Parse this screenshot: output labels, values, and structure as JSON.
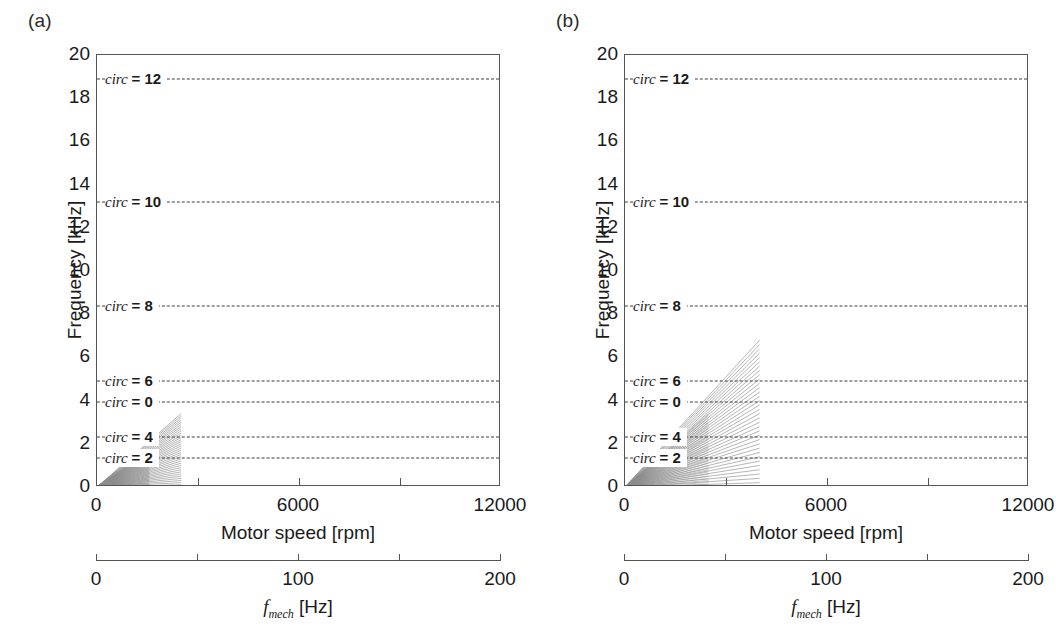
{
  "figure": {
    "panels": [
      {
        "tag": "(a)",
        "fan_label": "sideband-fan-a"
      },
      {
        "tag": "(b)",
        "fan_label": "sideband-fan-b"
      }
    ],
    "ylabel": "Frequency [kHz]",
    "xlabel": "Motor speed [rpm]",
    "sec_axis_label_text": "f",
    "sec_axis_label_sub": "mech",
    "sec_axis_label_unit": " [Hz]",
    "ytick_labels": [
      "20",
      "18",
      "16",
      "14",
      "12",
      "10",
      "8",
      "6",
      "4",
      "2",
      "0"
    ],
    "xtick_labels": [
      "0",
      "6000",
      "12000"
    ],
    "sec_tick_labels": [
      "0",
      "100",
      "200"
    ],
    "circ_labels": [
      "circ = 12",
      "circ = 10",
      "circ = 8",
      "circ = 6",
      "circ = 0",
      "circ = 4",
      "circ = 2"
    ],
    "colors": {
      "axis": "#555555",
      "dashed_line": "#3d3d3d",
      "fan": "#8d8d8d",
      "text": "#1a1a1a"
    }
  },
  "chart_data": {
    "type": "line",
    "title": "",
    "xlabel": "Motor speed [rpm]",
    "ylabel": "Frequency [kHz]",
    "xlim": [
      0,
      12000
    ],
    "ylim": [
      0,
      20
    ],
    "xticks": [
      0,
      3000,
      6000,
      9000,
      12000
    ],
    "xticklabels": [
      "0",
      "",
      "6000",
      "",
      "12000"
    ],
    "yticks": [
      0,
      2,
      4,
      6,
      8,
      10,
      12,
      14,
      16,
      18,
      20
    ],
    "secondary_xaxis": {
      "label": "f_mech [Hz]",
      "lim": [
        0,
        200
      ],
      "ticks": [
        0,
        50,
        100,
        150,
        200
      ],
      "ticklabels": [
        "0",
        "",
        "100",
        "",
        "200"
      ]
    },
    "grid": false,
    "legend": false,
    "horizontal_lines": [
      {
        "label": "circ = 12",
        "y": 18.9,
        "style": "dashed"
      },
      {
        "label": "circ = 10",
        "y": 13.2,
        "style": "dashed"
      },
      {
        "label": "circ = 8",
        "y": 8.4,
        "style": "dashed"
      },
      {
        "label": "circ = 6",
        "y": 4.9,
        "style": "dashed"
      },
      {
        "label": "circ = 0",
        "y": 3.95,
        "style": "dashed"
      },
      {
        "label": "circ = 4",
        "y": 2.3,
        "style": "dashed"
      },
      {
        "label": "circ = 2",
        "y": 1.35,
        "style": "dashed"
      }
    ],
    "panels": [
      {
        "name": "(a)",
        "ray_fan": {
          "origin": [
            0,
            0
          ],
          "x_end_rpm": 2500,
          "y_max_khz": 3.4,
          "n_rays": 34,
          "description": "dense fan of gray rays from origin, slopes 0 to 3.4 kHz at 2500 rpm"
        }
      },
      {
        "name": "(b)",
        "ray_fan": {
          "origin": [
            0,
            0
          ],
          "x_end_rpm": 4000,
          "y_max_khz": 6.8,
          "n_rays": 34,
          "description": "dense fan of gray rays from origin, slopes 0 to 6.8 kHz at 4000 rpm"
        }
      }
    ]
  }
}
